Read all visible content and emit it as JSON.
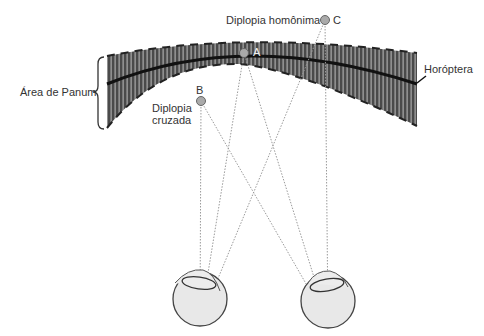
{
  "labels": {
    "panum_area": "Área de Panum",
    "horopter": "Horóptera",
    "crossed_diplopia_line1": "Diplopia",
    "crossed_diplopia_line2": "cruzada",
    "homonymous_diplopia": "Diplopia homônima",
    "point_a": "A",
    "point_b": "B",
    "point_c": "C"
  },
  "colors": {
    "band_fill": "#555555",
    "band_stripe": "#bbbbbb",
    "horopter_line": "#111111",
    "point_fill": "#aaaaaa",
    "point_stroke": "#666666",
    "ray": "#aaaaaa",
    "eye_fill": "#e6e6e6",
    "eye_stroke": "#444444",
    "text": "#333333"
  },
  "points": [
    {
      "id": "A",
      "x": 244,
      "y": 53
    },
    {
      "id": "B",
      "x": 201,
      "y": 101
    },
    {
      "id": "C",
      "x": 325,
      "y": 20
    }
  ],
  "eyes": [
    {
      "id": "left",
      "cx": 200,
      "cy": 300,
      "r": 28
    },
    {
      "id": "right",
      "cx": 328,
      "cy": 302,
      "r": 27
    }
  ]
}
